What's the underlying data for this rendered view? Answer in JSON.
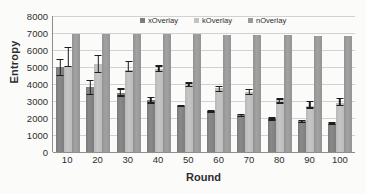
{
  "chart_data": {
    "type": "bar",
    "title": "",
    "xlabel": "Round",
    "ylabel": "Entropy",
    "categories": [
      "10",
      "20",
      "30",
      "40",
      "50",
      "60",
      "70",
      "80",
      "90",
      "100"
    ],
    "ylim": [
      0,
      8000
    ],
    "ytick_labels": [
      "8000",
      "7000",
      "6000",
      "5000",
      "4000",
      "3000",
      "2000",
      "1000",
      "0"
    ],
    "ytick_values": [
      8000,
      7000,
      6000,
      5000,
      4000,
      3000,
      2000,
      1000,
      0
    ],
    "grid": true,
    "legend_position": "top-center-inside",
    "series": [
      {
        "name": "xOverlay",
        "color": "#7d7d7d",
        "values": [
          5000,
          3800,
          3500,
          3050,
          2700,
          2400,
          2150,
          1950,
          1800,
          1650
        ],
        "err_low": [
          4450,
          3350,
          3250,
          2850,
          2620,
          2320,
          2050,
          1830,
          1700,
          1560
        ],
        "err_high": [
          5500,
          4250,
          3750,
          3250,
          2780,
          2480,
          2250,
          2050,
          1900,
          1740
        ]
      },
      {
        "name": "kOverlay",
        "color": "#c2c2c2",
        "values": [
          5050,
          5150,
          4800,
          4900,
          4000,
          3750,
          3550,
          3050,
          2700,
          2900
        ],
        "err_low": [
          4980,
          4650,
          4700,
          4700,
          3800,
          3500,
          3350,
          2850,
          2550,
          2700
        ],
        "err_high": [
          6200,
          5700,
          5350,
          5100,
          4100,
          3900,
          3700,
          3150,
          3020,
          3180
        ]
      },
      {
        "name": "nOverlay",
        "color": "#9a9a9a",
        "values": [
          6950,
          6950,
          6930,
          6930,
          6920,
          6900,
          6880,
          6870,
          6850,
          6840
        ],
        "err_low": [
          null,
          null,
          null,
          null,
          null,
          null,
          null,
          null,
          null,
          null
        ],
        "err_high": [
          null,
          null,
          null,
          null,
          null,
          null,
          null,
          null,
          null,
          null
        ]
      }
    ]
  }
}
